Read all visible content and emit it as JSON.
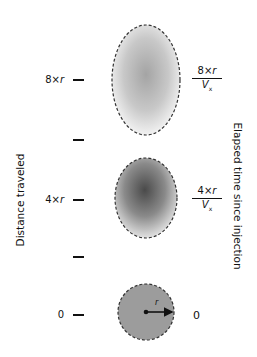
{
  "axis_left": {
    "title": "Distance traveled",
    "ticks": [
      {
        "label_num": "8×",
        "label_var": "r",
        "y": 80
      },
      {
        "label_num": "",
        "label_var": "",
        "y": 140
      },
      {
        "label_num": "4×",
        "label_var": "r",
        "y": 200
      },
      {
        "label_num": "",
        "label_var": "",
        "y": 257
      },
      {
        "label_num": "0",
        "label_var": "",
        "y": 314
      }
    ]
  },
  "axis_right": {
    "title": "Elapsed time since injection",
    "labels": [
      {
        "num": "8×",
        "var": "r",
        "den_var": "V",
        "den_sub": "x"
      },
      {
        "num": "4×",
        "var": "r",
        "den_var": "V",
        "den_sub": "x"
      },
      {
        "value": "0"
      }
    ]
  },
  "blobs": [
    {
      "name": "plume-at-8r",
      "cx": 146,
      "cy": 80,
      "rx": 34,
      "ry": 55,
      "shade_center": "#a8a8a8",
      "shade_edge": "#f0f0f0"
    },
    {
      "name": "plume-at-4r",
      "cx": 146,
      "cy": 198,
      "rx": 31,
      "ry": 40,
      "shade_center": "#5a5a5a",
      "shade_edge": "#dcdcdc"
    },
    {
      "name": "plume-at-0",
      "cx": 146,
      "cy": 312,
      "r": 28,
      "fill": "#9a9a9a"
    }
  ],
  "radius_label": "r",
  "colors": {
    "ink": "#111111",
    "dash": "#333333"
  }
}
